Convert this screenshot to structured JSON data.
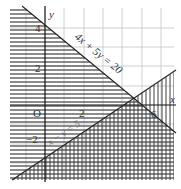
{
  "figure": {
    "title": "",
    "axes": {
      "x_label": "x",
      "y_label": "y",
      "origin_label": "O"
    },
    "ticks": {
      "x": [
        {
          "value": 2,
          "label": "2"
        },
        {
          "value": 6,
          "label": "6"
        }
      ],
      "y": [
        {
          "value": 4,
          "label": "4"
        },
        {
          "value": 2,
          "label": "2"
        },
        {
          "value": -2,
          "label": "−2"
        }
      ]
    },
    "lines": [
      {
        "equation": "4x + 5y = 20",
        "points": [
          [
            0,
            4
          ],
          [
            5,
            0
          ]
        ],
        "shading": "horizontal hatching (4x + 5y ≤ 20 side)"
      },
      {
        "equation": "x − y = 5",
        "points": [
          [
            5,
            0
          ],
          [
            -1.5,
            -6.5
          ]
        ],
        "shading": "vertical hatching (x − y ≥ 5 side)"
      }
    ],
    "colors": {
      "line": "#222222",
      "grid": "#bbbbbb",
      "hatch": "#444444",
      "background": "#ffffff"
    }
  },
  "labels": {
    "line1": "4x + 5y = 20",
    "line2": "x − y = 5",
    "x_axis": "x",
    "y_axis": "y",
    "origin": "O",
    "tick_x2": "2",
    "tick_x6": "6",
    "tick_y4": "4",
    "tick_y2": "2",
    "tick_yneg2": "−2"
  }
}
